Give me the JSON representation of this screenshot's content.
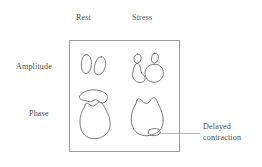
{
  "figure": {
    "title": "",
    "colors": {
      "background": "#ffffff",
      "stroke": "#6b6b6b",
      "box_border": "#9a9a9a",
      "text": "#4a4a4a"
    },
    "column_headers": [
      {
        "id": "rest",
        "label": "Rest"
      },
      {
        "id": "stress",
        "label": "Stress"
      }
    ],
    "row_labels": [
      {
        "id": "amplitude",
        "label": "Amplitude"
      },
      {
        "id": "phase",
        "label": "Phase"
      }
    ],
    "annotations": [
      {
        "id": "delayed-contraction",
        "line1": "Delayed",
        "line2": "contraction",
        "points_to": "phase-stress-lobe"
      }
    ],
    "cells": [
      {
        "row": "amplitude",
        "column": "rest",
        "shapes": "two tilted ellipses"
      },
      {
        "row": "amplitude",
        "column": "stress",
        "shapes": "two small ellipses above two large round blobs"
      },
      {
        "row": "phase",
        "column": "rest",
        "shapes": "curved crescent blob above a large rounded blob"
      },
      {
        "row": "phase",
        "column": "stress",
        "shapes": "notched blob with small lobe at lower right"
      }
    ]
  }
}
